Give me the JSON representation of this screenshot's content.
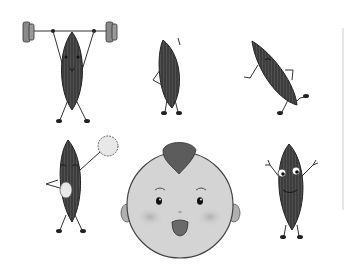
{
  "scene": {
    "description": "Grayscale cartoon illustration of five seed characters in various poses and a baby face",
    "characters": [
      {
        "name": "seed-weightlifter",
        "pose": "lifting barbell overhead"
      },
      {
        "name": "seed-hand-on-hip",
        "pose": "standing, hand on hip"
      },
      {
        "name": "seed-running",
        "pose": "tilted, running"
      },
      {
        "name": "seed-cheerleader",
        "pose": "holding pom-poms"
      },
      {
        "name": "baby-face",
        "pose": "smiling with open mouth and tuft of hair"
      },
      {
        "name": "seed-arms-up",
        "pose": "arms raised, big eyes"
      }
    ]
  },
  "colors": {
    "background": "#ffffff",
    "seed_fill": "#3d3d3d",
    "seed_stripe": "#5a5a5a",
    "outline": "#222222",
    "face_fill": "#d4d4d4",
    "face_cheek": "#b8b8b8",
    "hair": "#5c5c5c",
    "mouth": "#6a6a6a",
    "pompom": "#e8e8e8",
    "barbell_plate": "#8a8a8a",
    "edge_line": "#cfcfcf"
  }
}
